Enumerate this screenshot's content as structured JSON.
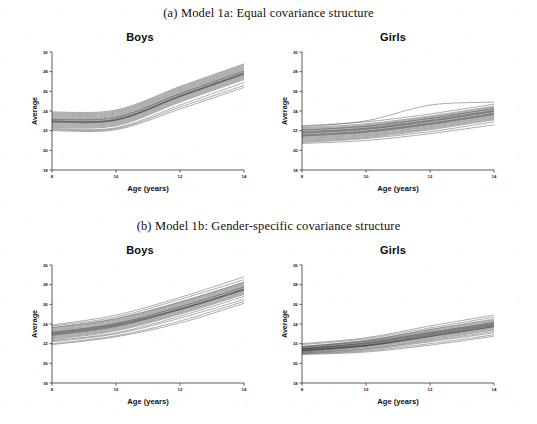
{
  "figure": {
    "caption_a": "(a) Model 1a: Equal covariance structure",
    "caption_b": "(b) Model 1b: Gender-specific covariance structure"
  },
  "panels": [
    {
      "id": "a-boys",
      "title": "Boys"
    },
    {
      "id": "a-girls",
      "title": "Girls"
    },
    {
      "id": "b-boys",
      "title": "Boys"
    },
    {
      "id": "b-girls",
      "title": "Girls"
    }
  ],
  "chart_data": [
    {
      "type": "line",
      "id": "a-boys",
      "title": "Boys",
      "panel_caption": "(a) Model 1a: Equal covariance structure",
      "xlabel": "Age  (years)",
      "ylabel": "Average",
      "xlim": [
        8,
        14
      ],
      "ylim": [
        18,
        30
      ],
      "xticks": [
        8,
        10,
        12,
        14
      ],
      "yticks": [
        18,
        20,
        22,
        24,
        26,
        28,
        30
      ],
      "grid": false,
      "legend": "none",
      "x": [
        8,
        10,
        12,
        14
      ],
      "n_series": 24,
      "description": "Spaghetti plot: flat from age 8 to 10 then steep linear rise to age 14",
      "series": [
        {
          "name": "s1",
          "values": [
            23.0,
            23.2,
            25.6,
            27.9
          ]
        },
        {
          "name": "s2",
          "values": [
            22.8,
            23.0,
            25.4,
            27.7
          ]
        },
        {
          "name": "s3",
          "values": [
            23.3,
            23.5,
            25.9,
            28.2
          ]
        },
        {
          "name": "s4",
          "values": [
            22.6,
            22.8,
            25.2,
            27.5
          ]
        },
        {
          "name": "s5",
          "values": [
            23.6,
            23.8,
            26.2,
            28.5
          ]
        },
        {
          "name": "s6",
          "values": [
            22.4,
            22.6,
            25.0,
            27.3
          ]
        },
        {
          "name": "s7",
          "values": [
            23.1,
            23.3,
            25.7,
            28.0
          ]
        },
        {
          "name": "s8",
          "values": [
            22.9,
            23.1,
            25.5,
            27.8
          ]
        },
        {
          "name": "s9",
          "values": [
            23.4,
            23.6,
            26.0,
            28.3
          ]
        },
        {
          "name": "s10",
          "values": [
            22.7,
            22.9,
            25.3,
            27.6
          ]
        },
        {
          "name": "s11",
          "values": [
            23.8,
            24.0,
            26.4,
            28.7
          ]
        },
        {
          "name": "s12",
          "values": [
            22.2,
            22.3,
            24.6,
            26.9
          ]
        },
        {
          "name": "s13",
          "values": [
            23.2,
            23.4,
            25.8,
            28.1
          ]
        },
        {
          "name": "s14",
          "values": [
            22.5,
            22.7,
            25.1,
            27.4
          ]
        },
        {
          "name": "s15",
          "values": [
            23.5,
            23.7,
            26.1,
            28.4
          ]
        },
        {
          "name": "s16",
          "values": [
            22.3,
            22.5,
            24.9,
            27.2
          ]
        },
        {
          "name": "s17",
          "values": [
            23.0,
            23.1,
            25.5,
            27.8
          ]
        },
        {
          "name": "s18",
          "values": [
            22.1,
            22.2,
            24.4,
            26.6
          ]
        },
        {
          "name": "s19",
          "values": [
            23.9,
            24.1,
            26.5,
            28.8
          ]
        },
        {
          "name": "s20",
          "values": [
            22.0,
            22.1,
            24.2,
            26.4
          ]
        },
        {
          "name": "s21",
          "values": [
            23.7,
            23.9,
            26.3,
            28.6
          ]
        },
        {
          "name": "s22",
          "values": [
            22.85,
            23.05,
            25.45,
            27.75
          ]
        },
        {
          "name": "s23",
          "values": [
            23.15,
            23.35,
            25.75,
            28.05
          ]
        },
        {
          "name": "s24",
          "values": [
            22.95,
            23.15,
            25.55,
            27.85
          ]
        }
      ]
    },
    {
      "type": "line",
      "id": "a-girls",
      "title": "Girls",
      "panel_caption": "(a) Model 1a: Equal covariance structure",
      "xlabel": "Age  (years)",
      "ylabel": "Average",
      "xlim": [
        8,
        14
      ],
      "ylim": [
        18,
        30
      ],
      "xticks": [
        8,
        10,
        12,
        14
      ],
      "yticks": [
        18,
        20,
        22,
        24,
        26,
        28,
        30
      ],
      "grid": false,
      "legend": "none",
      "x": [
        8,
        10,
        12,
        14
      ],
      "n_series": 24,
      "description": "Spaghetti plot: gentle near-linear rise from about 21.5 to about 24",
      "series": [
        {
          "name": "s1",
          "values": [
            21.7,
            22.1,
            22.9,
            23.9
          ]
        },
        {
          "name": "s2",
          "values": [
            21.5,
            21.9,
            22.7,
            23.7
          ]
        },
        {
          "name": "s3",
          "values": [
            22.0,
            22.4,
            23.2,
            24.2
          ]
        },
        {
          "name": "s4",
          "values": [
            21.3,
            21.7,
            22.5,
            23.5
          ]
        },
        {
          "name": "s5",
          "values": [
            22.3,
            22.7,
            23.5,
            24.5
          ]
        },
        {
          "name": "s6",
          "values": [
            21.1,
            21.5,
            22.3,
            23.3
          ]
        },
        {
          "name": "s7",
          "values": [
            21.8,
            22.2,
            23.0,
            24.0
          ]
        },
        {
          "name": "s8",
          "values": [
            21.6,
            22.0,
            22.8,
            23.8
          ]
        },
        {
          "name": "s9",
          "values": [
            22.1,
            22.5,
            23.3,
            24.3
          ]
        },
        {
          "name": "s10",
          "values": [
            21.4,
            21.8,
            22.6,
            23.6
          ]
        },
        {
          "name": "s11",
          "values": [
            22.4,
            23.0,
            24.6,
            24.9
          ]
        },
        {
          "name": "s12",
          "values": [
            20.9,
            21.3,
            22.1,
            23.1
          ]
        },
        {
          "name": "s13",
          "values": [
            21.9,
            22.3,
            23.1,
            24.1
          ]
        },
        {
          "name": "s14",
          "values": [
            21.2,
            21.6,
            22.4,
            23.4
          ]
        },
        {
          "name": "s15",
          "values": [
            22.2,
            22.6,
            23.4,
            24.4
          ]
        },
        {
          "name": "s16",
          "values": [
            21.0,
            21.4,
            22.2,
            23.2
          ]
        },
        {
          "name": "s17",
          "values": [
            21.75,
            22.15,
            22.95,
            23.95
          ]
        },
        {
          "name": "s18",
          "values": [
            20.8,
            21.2,
            21.9,
            22.9
          ]
        },
        {
          "name": "s19",
          "values": [
            22.5,
            22.9,
            23.7,
            24.7
          ]
        },
        {
          "name": "s20",
          "values": [
            20.7,
            21.0,
            21.7,
            22.6
          ]
        },
        {
          "name": "s21",
          "values": [
            22.05,
            22.45,
            23.25,
            24.25
          ]
        },
        {
          "name": "s22",
          "values": [
            21.55,
            21.95,
            22.75,
            23.75
          ]
        },
        {
          "name": "s23",
          "values": [
            21.85,
            22.25,
            23.05,
            24.05
          ]
        },
        {
          "name": "s24",
          "values": [
            21.45,
            21.85,
            22.65,
            23.65
          ]
        }
      ]
    },
    {
      "type": "line",
      "id": "b-boys",
      "title": "Boys",
      "panel_caption": "(b) Model 1b: Gender-specific covariance structure",
      "xlabel": "Age  (years)",
      "ylabel": "Average",
      "xlim": [
        8,
        14
      ],
      "ylim": [
        18,
        30
      ],
      "xticks": [
        8,
        10,
        12,
        14
      ],
      "yticks": [
        18,
        20,
        22,
        24,
        26,
        28,
        30
      ],
      "grid": false,
      "legend": "none",
      "x": [
        8,
        10,
        12,
        14
      ],
      "n_series": 24,
      "description": "Spaghetti plot: smooth continuous rise from about 23 to about 27.5",
      "series": [
        {
          "name": "s1",
          "values": [
            23.0,
            23.9,
            25.6,
            27.6
          ]
        },
        {
          "name": "s2",
          "values": [
            22.8,
            23.7,
            25.4,
            27.4
          ]
        },
        {
          "name": "s3",
          "values": [
            23.3,
            24.2,
            25.9,
            27.9
          ]
        },
        {
          "name": "s4",
          "values": [
            22.6,
            23.5,
            25.2,
            27.2
          ]
        },
        {
          "name": "s5",
          "values": [
            23.6,
            24.5,
            26.2,
            28.2
          ]
        },
        {
          "name": "s6",
          "values": [
            22.4,
            23.3,
            25.0,
            27.0
          ]
        },
        {
          "name": "s7",
          "values": [
            23.1,
            24.0,
            25.7,
            27.7
          ]
        },
        {
          "name": "s8",
          "values": [
            22.9,
            23.8,
            25.5,
            27.5
          ]
        },
        {
          "name": "s9",
          "values": [
            23.4,
            24.3,
            26.0,
            28.0
          ]
        },
        {
          "name": "s10",
          "values": [
            22.7,
            23.6,
            25.3,
            27.3
          ]
        },
        {
          "name": "s11",
          "values": [
            23.9,
            24.9,
            26.7,
            28.8
          ]
        },
        {
          "name": "s12",
          "values": [
            22.2,
            23.0,
            24.6,
            26.5
          ]
        },
        {
          "name": "s13",
          "values": [
            23.2,
            24.1,
            25.8,
            27.8
          ]
        },
        {
          "name": "s14",
          "values": [
            22.5,
            23.4,
            25.1,
            27.1
          ]
        },
        {
          "name": "s15",
          "values": [
            23.5,
            24.4,
            26.1,
            28.1
          ]
        },
        {
          "name": "s16",
          "values": [
            22.3,
            23.1,
            24.8,
            26.8
          ]
        },
        {
          "name": "s17",
          "values": [
            23.05,
            23.95,
            25.55,
            27.55
          ]
        },
        {
          "name": "s18",
          "values": [
            22.0,
            22.8,
            24.3,
            26.3
          ]
        },
        {
          "name": "s19",
          "values": [
            23.8,
            24.7,
            26.5,
            28.5
          ]
        },
        {
          "name": "s20",
          "values": [
            21.9,
            22.7,
            24.1,
            26.1
          ]
        },
        {
          "name": "s21",
          "values": [
            23.65,
            24.55,
            26.25,
            28.25
          ]
        },
        {
          "name": "s22",
          "values": [
            22.85,
            23.75,
            25.45,
            27.45
          ]
        },
        {
          "name": "s23",
          "values": [
            23.15,
            24.05,
            25.75,
            27.75
          ]
        },
        {
          "name": "s24",
          "values": [
            22.95,
            23.85,
            25.5,
            27.5
          ]
        }
      ]
    },
    {
      "type": "line",
      "id": "b-girls",
      "title": "Girls",
      "panel_caption": "(b) Model 1b: Gender-specific covariance structure",
      "xlabel": "Age  (years)",
      "ylabel": "Average",
      "xlim": [
        8,
        14
      ],
      "ylim": [
        18,
        30
      ],
      "xticks": [
        8,
        10,
        12,
        14
      ],
      "yticks": [
        18,
        20,
        22,
        24,
        26,
        28,
        30
      ],
      "grid": false,
      "legend": "none",
      "x": [
        8,
        10,
        12,
        14
      ],
      "n_series": 24,
      "description": "Spaghetti plot: tight bundle at age 8 near 21.3 fanning out to about 23-24.5 at age 14",
      "series": [
        {
          "name": "s1",
          "values": [
            21.4,
            21.9,
            22.9,
            23.9
          ]
        },
        {
          "name": "s2",
          "values": [
            21.3,
            21.8,
            22.8,
            23.8
          ]
        },
        {
          "name": "s3",
          "values": [
            21.5,
            22.1,
            23.1,
            24.1
          ]
        },
        {
          "name": "s4",
          "values": [
            21.2,
            21.7,
            22.6,
            23.6
          ]
        },
        {
          "name": "s5",
          "values": [
            21.7,
            22.3,
            23.4,
            24.4
          ]
        },
        {
          "name": "s6",
          "values": [
            21.1,
            21.5,
            22.4,
            23.4
          ]
        },
        {
          "name": "s7",
          "values": [
            21.45,
            22.0,
            23.0,
            24.0
          ]
        },
        {
          "name": "s8",
          "values": [
            21.35,
            21.85,
            22.85,
            23.85
          ]
        },
        {
          "name": "s9",
          "values": [
            21.6,
            22.2,
            23.2,
            24.2
          ]
        },
        {
          "name": "s10",
          "values": [
            21.25,
            21.75,
            22.7,
            23.7
          ]
        },
        {
          "name": "s11",
          "values": [
            21.9,
            22.5,
            23.6,
            24.7
          ]
        },
        {
          "name": "s12",
          "values": [
            21.0,
            21.35,
            22.2,
            23.1
          ]
        },
        {
          "name": "s13",
          "values": [
            21.5,
            22.05,
            23.05,
            24.05
          ]
        },
        {
          "name": "s14",
          "values": [
            21.15,
            21.6,
            22.5,
            23.5
          ]
        },
        {
          "name": "s15",
          "values": [
            21.65,
            22.25,
            23.3,
            24.3
          ]
        },
        {
          "name": "s16",
          "values": [
            21.05,
            21.45,
            22.3,
            23.25
          ]
        },
        {
          "name": "s17",
          "values": [
            21.42,
            21.95,
            22.95,
            23.95
          ]
        },
        {
          "name": "s18",
          "values": [
            20.95,
            21.25,
            22.0,
            22.9
          ]
        },
        {
          "name": "s19",
          "values": [
            22.0,
            22.6,
            23.8,
            24.9
          ]
        },
        {
          "name": "s20",
          "values": [
            20.9,
            21.15,
            21.85,
            22.75
          ]
        },
        {
          "name": "s21",
          "values": [
            21.72,
            22.35,
            23.45,
            24.5
          ]
        },
        {
          "name": "s22",
          "values": [
            21.32,
            21.82,
            22.75,
            23.75
          ]
        },
        {
          "name": "s23",
          "values": [
            21.52,
            22.1,
            23.15,
            24.15
          ]
        },
        {
          "name": "s24",
          "values": [
            21.28,
            21.78,
            22.72,
            23.72
          ]
        }
      ]
    }
  ]
}
